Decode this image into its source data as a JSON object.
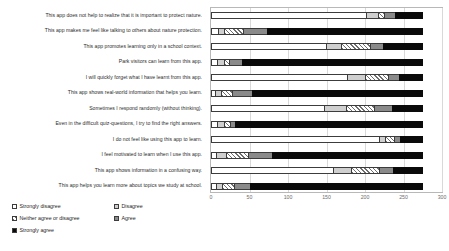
{
  "chart_data": {
    "type": "bar",
    "orientation": "horizontal",
    "stacked": true,
    "title": "",
    "xlabel": "",
    "ylabel": "",
    "xlim": [
      0,
      300
    ],
    "xticks": [
      0,
      50,
      100,
      150,
      200,
      250,
      300
    ],
    "grid": true,
    "legend_position": "bottom-left",
    "categories": [
      "This app does not help to realize that it is important to protect nature.",
      "This app makes me feel like talking to others about nature protection.",
      "This app promotes learning only in a school context.",
      "Park visitors can learn from this app.",
      "I will quickly forget what I have learnt from this app.",
      "This app shows real-world information that helps you learn.",
      "Sometimes I respond randomly (without thinking).",
      "Even in the difficult quiz-questions, I try to find the right answers.",
      "I do not feel like using this app to learn.",
      "I feel motivated to learn when I use this app.",
      "This app shows information in a confusing way.",
      "This app helps you learn more about topics we study at school."
    ],
    "series": [
      {
        "name": "Strongly disagree",
        "color": "#ffffff",
        "pattern": "solid-white",
        "values": [
          202,
          10,
          150,
          9,
          178,
          7,
          148,
          9,
          220,
          8,
          160,
          8
        ]
      },
      {
        "name": "Disagree",
        "color": "#cfcfcf",
        "pattern": "solid-light-grey",
        "values": [
          18,
          9,
          22,
          10,
          25,
          8,
          30,
          10,
          9,
          14,
          25,
          9
        ]
      },
      {
        "name": "Neither agree or disagree",
        "color": "#ffffff",
        "pattern": "hatched",
        "values": [
          9,
          26,
          38,
          8,
          31,
          16,
          37,
          9,
          13,
          30,
          37,
          17
        ]
      },
      {
        "name": "Agree",
        "color": "#8a8a8a",
        "pattern": "solid-mid-grey",
        "values": [
          15,
          33,
          18,
          19,
          16,
          27,
          25,
          8,
          9,
          33,
          20,
          22
        ]
      },
      {
        "name": "Strongly agree",
        "color": "#0a0a0a",
        "pattern": "solid-black",
        "values": [
          36,
          203,
          52,
          235,
          30,
          223,
          40,
          244,
          29,
          196,
          38,
          225
        ]
      }
    ]
  },
  "legend": {
    "items": [
      {
        "label": "Strongly disagree"
      },
      {
        "label": "Disagree"
      },
      {
        "label": "Neither agree or disagree"
      },
      {
        "label": "Agree"
      },
      {
        "label": "Strongly agree"
      }
    ]
  }
}
